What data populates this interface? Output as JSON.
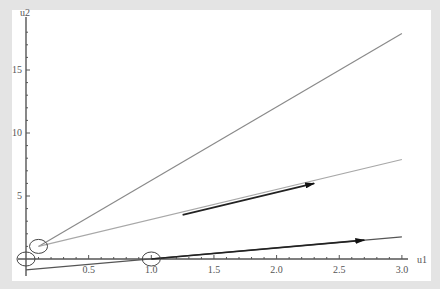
{
  "chart_data": {
    "type": "line",
    "title": "",
    "xlabel": "u1",
    "ylabel": "u2",
    "xlim": [
      0,
      3.0
    ],
    "ylim": [
      -0.9,
      18.5
    ],
    "grid": false,
    "x_ticks": [
      "0.5",
      "1.0",
      "1.5",
      "2.0",
      "2.5",
      "3.0"
    ],
    "y_ticks": [
      "5",
      "10",
      "15"
    ],
    "series": [
      {
        "name": "line-steep",
        "color": "#8a8a8a",
        "x": [
          0.1,
          3.0
        ],
        "y": [
          1.0,
          17.9
        ]
      },
      {
        "name": "line-middle",
        "color": "#a8a8a8",
        "x": [
          0.1,
          3.0
        ],
        "y": [
          1.0,
          7.9
        ]
      },
      {
        "name": "line-bottom",
        "color": "#555555",
        "x": [
          0.0,
          3.0
        ],
        "y": [
          -0.87,
          1.75
        ]
      }
    ],
    "arrows": [
      {
        "from": [
          1.25,
          3.5
        ],
        "to": [
          2.3,
          6.0
        ]
      },
      {
        "from": [
          1.0,
          0.0
        ],
        "to": [
          2.7,
          1.5
        ]
      }
    ],
    "circles": [
      {
        "center": [
          0.0,
          0.0
        ]
      },
      {
        "center": [
          0.1,
          1.0
        ]
      },
      {
        "center": [
          1.0,
          0.0
        ]
      }
    ]
  }
}
